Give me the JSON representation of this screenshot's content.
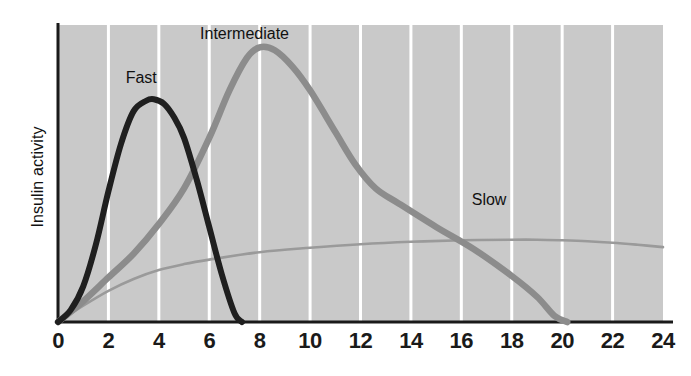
{
  "chart_data": {
    "type": "line",
    "title": "",
    "subtitle": "",
    "xlabel": "",
    "ylabel": "Insulin activity",
    "xlim": [
      0,
      24
    ],
    "ylim": [
      0,
      1
    ],
    "xticks": [
      "0",
      "2",
      "4",
      "6",
      "8",
      "10",
      "12",
      "14",
      "16",
      "18",
      "20",
      "22",
      "24"
    ],
    "yticks": [],
    "grid": "vertical white gridlines on gray panel",
    "legend_position": "inline annotations on curves",
    "plot_background": "#c9c9c9",
    "gridline_color": "#ffffff",
    "axis_color": "#1a1a1a",
    "series": [
      {
        "name": "Fast",
        "color": "#1f1f1f",
        "label_x": 3.3,
        "label_y": 0.82,
        "x": [
          0,
          0.5,
          1,
          1.5,
          2,
          2.5,
          3,
          3.5,
          3.8,
          4.2,
          4.6,
          5,
          5.5,
          6,
          6.5,
          7,
          7.3
        ],
        "values": [
          0.0,
          0.04,
          0.12,
          0.26,
          0.44,
          0.6,
          0.71,
          0.745,
          0.75,
          0.735,
          0.69,
          0.62,
          0.48,
          0.32,
          0.16,
          0.03,
          0.0
        ]
      },
      {
        "name": "Intermediate",
        "color": "#8c8c8c",
        "label_x": 7.4,
        "label_y": 0.97,
        "x": [
          0,
          1,
          2,
          3,
          4,
          5,
          6,
          6.8,
          7.5,
          8.0,
          8.6,
          9.3,
          10,
          11,
          11.8,
          12.6,
          13.5,
          15,
          16.5,
          18,
          19,
          19.7,
          20.2
        ],
        "values": [
          0.0,
          0.07,
          0.15,
          0.23,
          0.33,
          0.45,
          0.62,
          0.78,
          0.89,
          0.925,
          0.915,
          0.86,
          0.78,
          0.64,
          0.53,
          0.45,
          0.4,
          0.32,
          0.245,
          0.155,
          0.085,
          0.02,
          0.0
        ]
      },
      {
        "name": "Slow",
        "color": "#9a9a9a",
        "label_x": 17.1,
        "label_y": 0.41,
        "x": [
          0,
          1,
          2,
          3,
          4,
          5,
          6,
          8,
          10,
          12,
          14,
          16,
          18,
          19,
          20,
          21,
          22,
          23,
          24
        ],
        "values": [
          0.0,
          0.055,
          0.105,
          0.145,
          0.175,
          0.195,
          0.21,
          0.235,
          0.25,
          0.262,
          0.27,
          0.275,
          0.277,
          0.277,
          0.275,
          0.272,
          0.267,
          0.26,
          0.252
        ]
      }
    ]
  }
}
